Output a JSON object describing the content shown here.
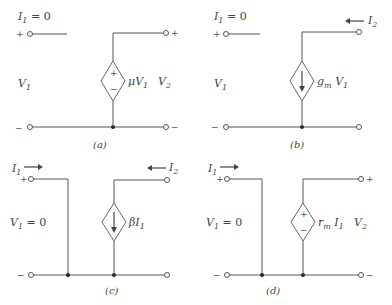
{
  "circuits": [
    {
      "id": "a",
      "caption": "(a)",
      "current_label": "I",
      "current_sub": "1",
      "current_eq": " = 0",
      "left_voltage": "V",
      "left_voltage_sub": "1",
      "left_voltage_eq": "",
      "source_type": "voltage",
      "source_label": "μV",
      "source_label_sub": "1",
      "right_voltage": "V",
      "right_voltage_sub": "2",
      "right_current": ""
    },
    {
      "id": "b",
      "caption": "(b)",
      "current_label": "I",
      "current_sub": "1",
      "current_eq": " = 0",
      "left_voltage": "V",
      "left_voltage_sub": "1",
      "left_voltage_eq": "",
      "source_type": "current",
      "source_label": "g",
      "source_label_sub": "m",
      "source_label_tail": " V",
      "source_label_tail_sub": "1",
      "right_voltage": "",
      "right_current": "I",
      "right_current_sub": "2"
    },
    {
      "id": "c",
      "caption": "(c)",
      "current_label": "I",
      "current_sub": "1",
      "left_voltage": "V",
      "left_voltage_sub": "1",
      "left_voltage_eq": " = 0",
      "source_type": "current",
      "source_label": "βI",
      "source_label_sub": "1",
      "right_current": "I",
      "right_current_sub": "2"
    },
    {
      "id": "d",
      "caption": "(d)",
      "current_label": "I",
      "current_sub": "1",
      "left_voltage": "V",
      "left_voltage_sub": "1",
      "left_voltage_eq": " = 0",
      "source_type": "voltage",
      "source_label": "r",
      "source_label_sub": "m",
      "source_label_tail": " I",
      "source_label_tail_sub": "1",
      "right_voltage": "V",
      "right_voltage_sub": "2"
    }
  ],
  "signs": {
    "plus": "+",
    "minus": "−"
  }
}
